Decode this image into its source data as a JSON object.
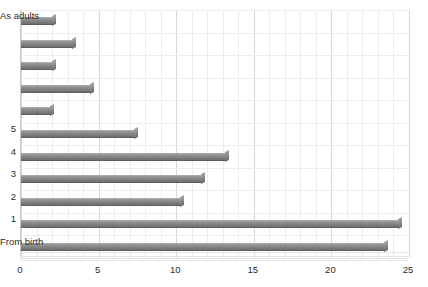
{
  "chart_data": {
    "type": "bar",
    "orientation": "horizontal",
    "title": "",
    "xlabel": "",
    "ylabel": "",
    "xlim": [
      0,
      25
    ],
    "xticks": [
      "0",
      "5",
      "10",
      "15",
      "20",
      "25"
    ],
    "xtick_values": [
      0,
      5,
      10,
      15,
      20,
      25
    ],
    "grid": true,
    "grid_minor": true,
    "legend": null,
    "bar_color": "#8a8a8a",
    "categories": [
      "From birth",
      "1",
      "2",
      "3",
      "4",
      "5",
      "",
      "",
      "",
      "",
      "As adults"
    ],
    "values": [
      23.5,
      24.4,
      10.4,
      11.7,
      13.3,
      7.4,
      2.0,
      4.6,
      2.1,
      3.4,
      2.1
    ],
    "bars_bottom_to_top": [
      {
        "label": "From birth",
        "value": 23.5
      },
      {
        "label": "1",
        "value": 24.4
      },
      {
        "label": "2",
        "value": 10.4
      },
      {
        "label": "3",
        "value": 11.7
      },
      {
        "label": "4",
        "value": 13.3
      },
      {
        "label": "5",
        "value": 7.4
      },
      {
        "label": "",
        "value": 2.0
      },
      {
        "label": "",
        "value": 4.6
      },
      {
        "label": "",
        "value": 2.1
      },
      {
        "label": "",
        "value": 3.4
      },
      {
        "label": "As adults",
        "value": 2.1
      }
    ]
  },
  "axis": {
    "y_visible_labels": [
      "As adults",
      "5",
      "4",
      "3",
      "2",
      "1",
      "From birth"
    ],
    "x_labels": [
      "0",
      "5",
      "10",
      "15",
      "20",
      "25"
    ]
  }
}
